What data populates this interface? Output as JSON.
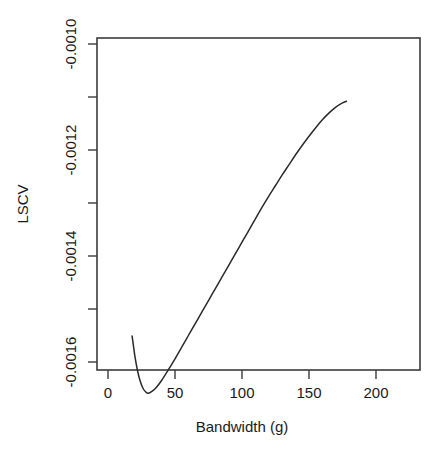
{
  "figure": {
    "name": "lscv-bandwidth-plot",
    "top_cropped_text": "",
    "background_color": "#ffffff",
    "line_color": "#2a2a2a",
    "axis_color": "#3b3b3b"
  },
  "chart_data": {
    "type": "line",
    "title": "",
    "xlabel": "Bandwidth (g)",
    "ylabel": "LSCV",
    "xlim": [
      0,
      200
    ],
    "ylim": [
      -0.0016927,
      -0.0009768
    ],
    "grid": false,
    "legend": null,
    "xticks": [
      0,
      50,
      100,
      150,
      200
    ],
    "xtick_labels": [
      "0",
      "50",
      "100",
      "150",
      "200"
    ],
    "yticks": [
      -0.001,
      -0.0012,
      -0.0014,
      -0.0016
    ],
    "ytick_labels": [
      "-0.0010",
      "-0.0012",
      "-0.0014",
      "-0.0016"
    ],
    "yticks_minor": [
      -0.0011,
      -0.0013,
      -0.0015
    ],
    "series": [
      {
        "name": "LSCV",
        "x": [
          18,
          20,
          22,
          24,
          26,
          28,
          30,
          33,
          36,
          40,
          45,
          50,
          55,
          60,
          65,
          70,
          75,
          80,
          85,
          90,
          95,
          100,
          105,
          110,
          115,
          120,
          125,
          130,
          135,
          140,
          145,
          150,
          155,
          160,
          165,
          170,
          175,
          178
        ],
        "y": [
          -0.001551,
          -0.001588,
          -0.001616,
          -0.001636,
          -0.001649,
          -0.001656,
          -0.001659,
          -0.001655,
          -0.001648,
          -0.001635,
          -0.001615,
          -0.001594,
          -0.001572,
          -0.00155,
          -0.001528,
          -0.001506,
          -0.001484,
          -0.001462,
          -0.00144,
          -0.001418,
          -0.001396,
          -0.001374,
          -0.001352,
          -0.00133,
          -0.001308,
          -0.001287,
          -0.001267,
          -0.001247,
          -0.001228,
          -0.001209,
          -0.001191,
          -0.001174,
          -0.001158,
          -0.001143,
          -0.00113,
          -0.001119,
          -0.001111,
          -0.001108
        ]
      }
    ],
    "minimum": {
      "x": 31,
      "y": -0.001659
    },
    "annotations": []
  }
}
